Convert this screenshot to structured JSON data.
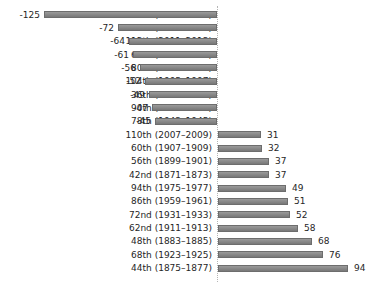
{
  "chart_data": {
    "type": "bar",
    "orientation": "horizontal",
    "title": "",
    "xlabel": "",
    "ylabel": "",
    "legend": null,
    "grid": false,
    "xlim": [
      -135,
      105
    ],
    "zero_line": "dotted",
    "bar_color": "#808080",
    "axis_color": "#b5b5b5",
    "text_color": "#262626",
    "categories": [
      "54th (1895–1897)",
      "76th (1939–1941)",
      "112th (2011–2013)",
      "64th (1915–1917)",
      "80th (1947–1949)",
      "104th (1995–1997)",
      "36th (1859–1861)",
      "90th (1967–1969)",
      "78th (1943–1945)",
      "110th (2007–2009)",
      "60th (1907–1909)",
      "56th (1899–1901)",
      "42nd (1871–1873)",
      "94th (1975–1977)",
      "86th (1959–1961)",
      "72nd (1931–1933)",
      "62nd (1911–1913)",
      "48th (1883–1885)",
      "68th (1923–1925)",
      "44th (1875–1877)"
    ],
    "values": [
      -125,
      -72,
      -64,
      -61,
      -56,
      -52,
      -49,
      -47,
      -45,
      31,
      32,
      37,
      37,
      49,
      51,
      52,
      58,
      68,
      76,
      94
    ]
  }
}
